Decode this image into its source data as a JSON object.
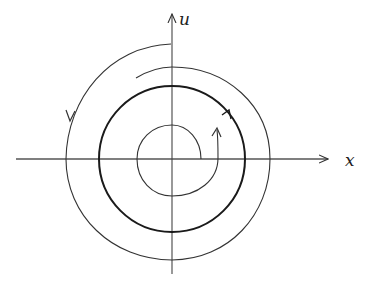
{
  "figure": {
    "type": "phase-portrait",
    "axes": {
      "horizontal_label": "x",
      "vertical_label": "u"
    },
    "elements": [
      {
        "name": "limit-cycle",
        "kind": "closed circle",
        "style": "bold",
        "direction": "counterclockwise"
      },
      {
        "name": "outer-trajectory",
        "kind": "spiral inward",
        "direction": "counterclockwise"
      },
      {
        "name": "inner-trajectory",
        "kind": "spiral outward",
        "direction": "counterclockwise"
      }
    ]
  },
  "colors": {
    "line": "#333333",
    "bold": "#1a1a1a",
    "background": "#ffffff"
  }
}
